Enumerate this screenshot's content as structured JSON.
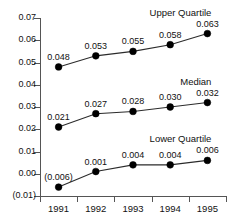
{
  "chart_data": {
    "type": "line",
    "title": "",
    "subtitle": "",
    "xlabel": "",
    "ylabel": "",
    "categories": [
      "1991",
      "1992",
      "1993",
      "1994",
      "1995"
    ],
    "ylim": [
      -0.01,
      0.07
    ],
    "xlim": [
      0,
      5
    ],
    "grid": false,
    "legend_position": "inline-right-end",
    "y_ticks": [
      0.07,
      0.06,
      0.05,
      0.04,
      0.03,
      0.02,
      0.01,
      0.0,
      -0.01
    ],
    "y_tick_labels": [
      "0.07",
      "0.06",
      "0.05",
      "0.04",
      "0.03",
      "0.02",
      "0.01",
      "0.00",
      "(0.01)"
    ],
    "negative_number_format": "parentheses",
    "marker": "filled-circle",
    "marker_color": "#000000",
    "line_color": "#2b2b2b",
    "series": [
      {
        "name": "Upper Quartile",
        "values": [
          0.048,
          0.053,
          0.055,
          0.058,
          0.063
        ],
        "labels": [
          "0.048",
          "0.053",
          "0.055",
          "0.058",
          "0.063"
        ]
      },
      {
        "name": "Median",
        "values": [
          0.021,
          0.027,
          0.028,
          0.03,
          0.032
        ],
        "labels": [
          "0.021",
          "0.027",
          "0.028",
          "0.030",
          "0.032"
        ]
      },
      {
        "name": "Lower Quartile",
        "values": [
          -0.006,
          0.001,
          0.004,
          0.004,
          0.006
        ],
        "labels": [
          "(0.006)",
          "0.001",
          "0.004",
          "0.004",
          "0.006"
        ]
      }
    ]
  },
  "axis": {
    "y_labels": [
      "0.07",
      "0.06",
      "0.05",
      "0.04",
      "0.03",
      "0.02",
      "0.01",
      "0.00",
      "(0.01)"
    ],
    "x_labels": [
      "1991",
      "1992",
      "1993",
      "1994",
      "1995"
    ]
  },
  "series_names": {
    "upper": "Upper Quartile",
    "median": "Median",
    "lower": "Lower Quartile"
  }
}
